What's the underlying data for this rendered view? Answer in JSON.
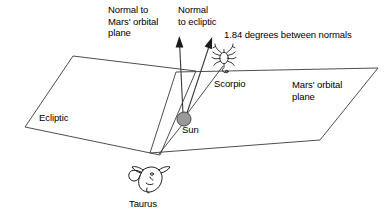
{
  "diagram": {
    "labels": {
      "normal_mars": "Normal to\nMars' orbital\nplane",
      "normal_ecliptic": "Normal\nto ecliptic",
      "angle_note": "1.84 degrees between normals",
      "scorpio": "Scorpio",
      "mars_plane": "Mars' orbital\nplane",
      "ecliptic": "Ecliptic",
      "sun": "Sun",
      "taurus": "Taurus"
    },
    "values": {
      "angle_degrees": "1.84",
      "angle_units": "degrees"
    },
    "colors": {
      "background": "#ffffff",
      "stroke": "#3a3a3a",
      "text": "#000000",
      "sun_fill": "#9a9a9a",
      "sun_stroke": "#4a4a4a",
      "figure_stroke": "#1a1a1a"
    },
    "icons": {
      "sun": "sun-circle-icon",
      "scorpio": "scorpio-scorpion-icon",
      "taurus": "taurus-bull-head-icon",
      "normal_arrow": "arrow-up-icon"
    },
    "geometry": {
      "ecliptic_plane_points": "73,56 196,71 160,155 25,127",
      "mars_plane_points": "176,72 378,68 320,140 150,153",
      "sun_center": [
        184,
        119
      ],
      "sun_radius": 7,
      "arrow_mars_normal": {
        "from": [
          183,
          114
        ],
        "to": [
          179,
          37
        ]
      },
      "arrow_ecliptic_normal": {
        "from": [
          186,
          114
        ],
        "to": [
          212,
          37
        ]
      },
      "sight_line_scorpio": {
        "from": [
          186,
          115
        ],
        "to": [
          222,
          67
        ]
      },
      "sight_line_taurus": {
        "from": [
          181,
          124
        ],
        "to": [
          160,
          154
        ]
      }
    }
  }
}
